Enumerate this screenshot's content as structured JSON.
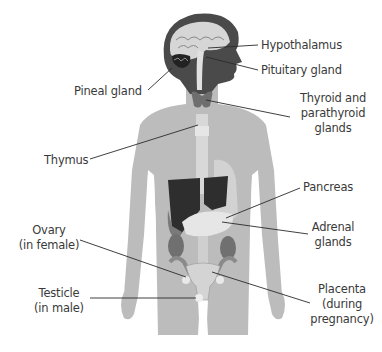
{
  "diagram": {
    "colors": {
      "background": "#ffffff",
      "body": "#b9b9b9",
      "head_dark": "#4a4a4a",
      "brain": "#d8d8d8",
      "liver": "#2e2e2e",
      "kidney": "#6a6a6a",
      "organ_light": "#e4e4e4",
      "leader_line": "#2a2a2a",
      "label_text": "#3a3a3a"
    },
    "labels": {
      "hypothalamus": "Hypothalamus",
      "pituitary": "Pituitary gland",
      "pineal": "Pineal gland",
      "thyroid_line1": "Thyroid and",
      "thyroid_line2": "parathyroid",
      "thyroid_line3": "glands",
      "thymus": "Thymus",
      "pancreas": "Pancreas",
      "adrenal_line1": "Adrenal",
      "adrenal_line2": "glands",
      "ovary_line1": "Ovary",
      "ovary_line2": "(in female)",
      "testicle_line1": "Testicle",
      "testicle_line2": "(in male)",
      "placenta_line1": "Placenta",
      "placenta_line2": "(during",
      "placenta_line3": "pregnancy)"
    }
  }
}
